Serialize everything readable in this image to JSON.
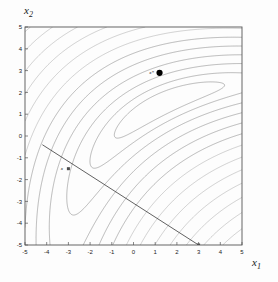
{
  "figure": {
    "background_color": "#fdfdfd",
    "frame_color": "#555555",
    "contour_color": "#7a7a7a",
    "line_color": "#3a3a3a",
    "marker_color": "#000000"
  },
  "labels": {
    "xlabel_base": "x",
    "xlabel_sub": "1",
    "ylabel_base": "x",
    "ylabel_sub": "2"
  },
  "chart_data": {
    "type": "line",
    "title": "",
    "subtitle": "",
    "xlabel": "x1",
    "ylabel": "x2",
    "xlim": [
      -5,
      5
    ],
    "ylim": [
      -5,
      5
    ],
    "grid": false,
    "legend": "none",
    "plot_kind": "contour-plot-with-constraint-line",
    "xticks": [
      -5,
      -4,
      -3,
      -2,
      -1,
      0,
      1,
      2,
      3,
      4,
      5
    ],
    "xtick_labels": [
      "-5",
      "-4",
      "-3",
      "-2",
      "-1",
      "0",
      "1",
      "2",
      "3",
      "4",
      "5"
    ],
    "yticks": [
      -5,
      -4,
      -3,
      -2,
      -1,
      0,
      1,
      2,
      3,
      4,
      5
    ],
    "ytick_labels": [
      "-5",
      "-4",
      "-3",
      "-2",
      "-1",
      "0",
      "1",
      "2",
      "3",
      "4",
      "5"
    ],
    "contours": {
      "description": "Nested banana-shaped (Rosenbrock-like) level curves of an objective function; contours are widely spaced near the curved valley running from lower-left up to the upper-right, and become extremely dense toward the upper-left and lower-right corners.",
      "n_levels": 34,
      "valley_axis_from": [
        -2.6,
        -1.0
      ],
      "valley_axis_to": [
        5.0,
        5.0
      ],
      "innermost_level_center": [
        -1.6,
        0.6
      ]
    },
    "series": [
      {
        "name": "constraint-line",
        "type": "line",
        "points": [
          [
            -4.2,
            -0.4
          ],
          [
            3.0,
            -5.0
          ]
        ],
        "style": "solid",
        "color": "#3a3a3a"
      }
    ],
    "annotations": [
      {
        "name": "solution-point",
        "label": "x*",
        "x": 1.2,
        "y": 2.9,
        "marker": "filled-circle",
        "label_position": "left"
      },
      {
        "name": "constraint-point",
        "label": "x",
        "x": -3.0,
        "y": -1.5,
        "marker": "small-square",
        "label_position": "left"
      },
      {
        "name": "axis-intercept-point",
        "label": "",
        "x": 3.0,
        "y": -5.0,
        "marker": "small-square",
        "label_position": "below"
      }
    ]
  }
}
